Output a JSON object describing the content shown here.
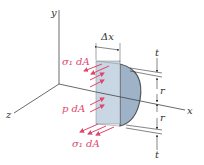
{
  "diagram": {
    "axes": {
      "x_label": "x",
      "y_label": "y",
      "z_label": "z"
    },
    "dimensions": {
      "width_label": "Δx",
      "radius_top_label": "r",
      "radius_bottom_label": "r",
      "thickness_top_label": "t",
      "thickness_bottom_label": "t"
    },
    "forces": {
      "top_stress_label": "σ₁ dA",
      "pressure_label": "p dA",
      "bottom_stress_label": "σ₁ dA"
    },
    "colors": {
      "arrow": "#e0456a",
      "block_face": "#c9d6e3",
      "block_curve": "#9fb3c8",
      "axis": "#444444"
    }
  }
}
